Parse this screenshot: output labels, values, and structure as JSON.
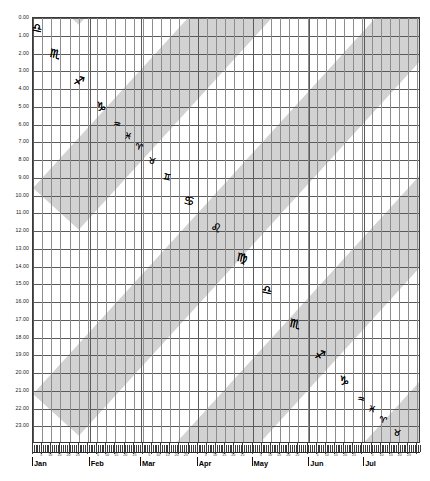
{
  "chart": {
    "type": "scatter",
    "title": "",
    "xlabel": "",
    "ylabel": "",
    "background_color": "#ffffff",
    "band_color": "#d2d2d2",
    "grid_color": "#5a5a5a",
    "symbol_color": "#000000"
  },
  "y_axis": {
    "min": 0,
    "max": 23,
    "step": 1,
    "unit": "hour",
    "ticks": [
      "0.00",
      "1.00",
      "2.00",
      "3.00",
      "4.00",
      "5.00",
      "6.00",
      "7.00",
      "8.00",
      "9.00",
      "10.00",
      "11.00",
      "12.00",
      "13.00",
      "14.00",
      "15.00",
      "16.00",
      "17.00",
      "18.00",
      "19.00",
      "20.00",
      "21.00",
      "22.00",
      "23.00"
    ]
  },
  "x_axis": {
    "months": [
      {
        "label": "Jan",
        "days": 31
      },
      {
        "label": "Feb",
        "days": 28
      },
      {
        "label": "Mar",
        "days": 31
      },
      {
        "label": "Apr",
        "days": 30
      },
      {
        "label": "May",
        "days": 31
      },
      {
        "label": "Jun",
        "days": 30
      },
      {
        "label": "Jul",
        "days": 31
      }
    ],
    "day_tick_labels": [
      "5",
      "10",
      "15",
      "20",
      "25"
    ],
    "total_days": 212,
    "minor_tick_interval_days": 1,
    "major_tick_interval_days": 5
  },
  "bands": {
    "count": 11,
    "color": "#d2d2d2",
    "slope_hours_per_day": -0.1132,
    "thickness_hours": 5.2,
    "period_hours": 11.6,
    "description": "diagonal shaded bands rising left to right"
  },
  "chart_data": {
    "type": "scatter",
    "title": "",
    "xlabel": "",
    "ylabel": "",
    "xlim": [
      "Jan 1",
      "Jul 31"
    ],
    "ylim": [
      0,
      23
    ],
    "grid": true,
    "legend": "none",
    "series": [
      {
        "name": "zodiac-chain-upper",
        "points": [
          {
            "symbol": "♎",
            "name": "Libra",
            "day": 2,
            "hour": 0.55
          },
          {
            "symbol": "♏",
            "name": "Scorpio",
            "day": 12,
            "hour": 2.05
          },
          {
            "symbol": "♐",
            "name": "Sagittarius",
            "day": 25,
            "hour": 3.55
          },
          {
            "symbol": "♑",
            "name": "Capricorn",
            "day": 37,
            "hour": 5.0
          },
          {
            "symbol": "♒",
            "name": "Aquarius",
            "day": 46,
            "hour": 5.95
          },
          {
            "symbol": "♓",
            "name": "Pisces",
            "day": 52,
            "hour": 6.65
          },
          {
            "symbol": "♈",
            "name": "Aries",
            "day": 58,
            "hour": 7.25
          },
          {
            "symbol": "♉",
            "name": "Taurus",
            "day": 65,
            "hour": 8.05
          },
          {
            "symbol": "♊",
            "name": "Gemini",
            "day": 73,
            "hour": 8.95
          },
          {
            "symbol": "♋",
            "name": "Cancer",
            "day": 85,
            "hour": 10.3
          },
          {
            "symbol": "♌",
            "name": "Leo",
            "day": 100,
            "hour": 11.85
          },
          {
            "symbol": "♍",
            "name": "Virgo",
            "day": 114,
            "hour": 13.5
          },
          {
            "symbol": "♎",
            "name": "Libra",
            "day": 128,
            "hour": 15.35
          },
          {
            "symbol": "♏",
            "name": "Scorpio",
            "day": 143,
            "hour": 17.25
          },
          {
            "symbol": "♐",
            "name": "Sagittarius",
            "day": 157,
            "hour": 19.0
          },
          {
            "symbol": "♑",
            "name": "Capricorn",
            "day": 170,
            "hour": 20.45
          },
          {
            "symbol": "♒",
            "name": "Aquarius",
            "day": 179,
            "hour": 21.45
          },
          {
            "symbol": "♓",
            "name": "Pisces",
            "day": 185,
            "hour": 22.05
          },
          {
            "symbol": "♈",
            "name": "Aries",
            "day": 191,
            "hour": 22.65
          },
          {
            "symbol": "♉",
            "name": "Taurus",
            "day": 199,
            "hour": 23.4
          }
        ]
      }
    ]
  }
}
